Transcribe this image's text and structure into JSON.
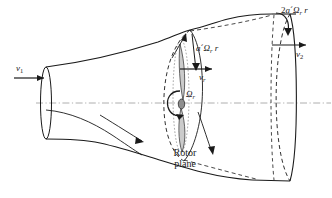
{
  "figure": {
    "kind": "wind-turbine-stream-tube-diagram",
    "background_color": "#ffffff",
    "line_color": "#1a1a1a",
    "axis_color": "#8a8a8a"
  },
  "labels": {
    "inlet_velocity": {
      "base": "v",
      "sub": "1",
      "text": "v1"
    },
    "outlet_velocity": {
      "base": "v",
      "sub": "2",
      "text": "v2"
    },
    "rotor_velocity": {
      "base": "v",
      "sub": "r",
      "text": "vr"
    },
    "rotor_angular_speed": {
      "base": "Ω",
      "sub": "r",
      "text": "Ωr"
    },
    "induced_tangential_rotor": {
      "prefix": "a",
      "prime": "´",
      "omega": "Ω",
      "sub": "r",
      "radius": "r",
      "text": "a´Ωr r"
    },
    "induced_tangential_wake": {
      "coefficient": "2",
      "prefix": "a",
      "prime": "´",
      "omega": "Ω",
      "sub": "r",
      "radius": "r",
      "text": "2a´Ωr r"
    },
    "rotor_plane_line1": "Rotor",
    "rotor_plane_line2": "plane"
  },
  "icons": {
    "inlet_arrow": "arrow-right-icon",
    "outlet_arrow": "arrow-right-icon",
    "rotor_velocity_arrow": "arrow-right-icon",
    "tangential_arrow_rotor": "arrow-down-icon",
    "tangential_arrow_wake": "curved-arrow-down-icon",
    "rotation_arrow": "circular-arrow-icon",
    "leader_arrow_upstream": "leader-arrow-icon",
    "leader_arrow_rotor_plane": "leader-arrow-icon",
    "centerline": "dash-dot-axis-icon"
  }
}
